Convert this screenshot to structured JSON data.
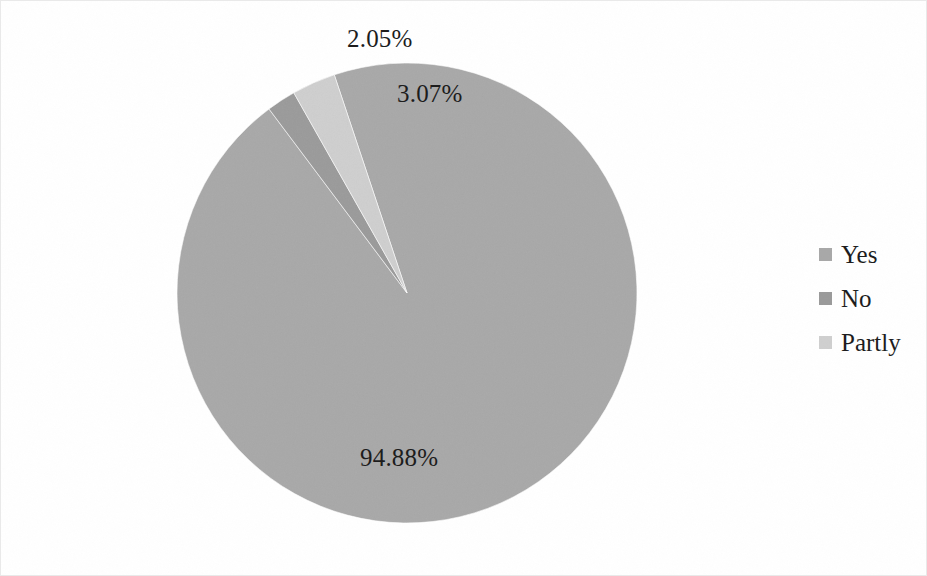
{
  "chart_data": {
    "type": "pie",
    "title": "",
    "categories": [
      "Yes",
      "No",
      "Partly"
    ],
    "values": [
      94.88,
      2.05,
      3.07
    ],
    "labels": [
      "94.88%",
      "2.05%",
      "3.07%"
    ],
    "legend_position": "right",
    "grid": false,
    "xlabel": "",
    "ylabel": "",
    "colors": [
      "#a8a8a8",
      "#9a9a9a",
      "#cfcfcf"
    ],
    "slice_start_angle_deg": 0,
    "slice_direction": "clockwise"
  },
  "labels": {
    "no_pct": "2.05%",
    "partly_pct": "3.07%",
    "yes_pct": "94.88%"
  },
  "legend": {
    "items": [
      {
        "label": "Yes",
        "color": "#a8a8a8"
      },
      {
        "label": "No",
        "color": "#9a9a9a"
      },
      {
        "label": "Partly",
        "color": "#cfcfcf"
      }
    ]
  },
  "style": {
    "background": "#ffffff",
    "border_color": "#e9e9e9",
    "text_color": "#1b1b1b"
  }
}
